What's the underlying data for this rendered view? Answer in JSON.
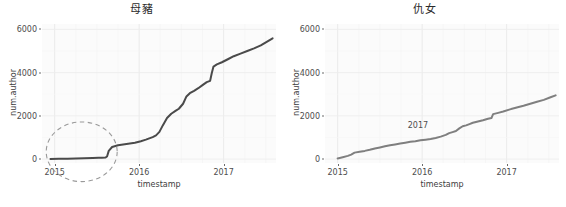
{
  "figure": {
    "width": 566,
    "height": 207,
    "background": "#ffffff",
    "panel_background": "#fbfbfb",
    "gridline_color": "#f0f0f0",
    "axis_text_color": "#4d4d4d"
  },
  "chart_data": [
    {
      "type": "line",
      "title": "母豬",
      "xlabel": "timestamp",
      "ylabel": "num.author",
      "grid": true,
      "legend": null,
      "line_color": "#4a4a4a",
      "line_width": 2.0,
      "xlim": [
        2014.85,
        2017.62
      ],
      "ylim": [
        -180,
        6250
      ],
      "xticks": [
        "2015",
        "2016",
        "2017"
      ],
      "xtick_values": [
        2015,
        2016,
        2017
      ],
      "yticks": [
        "0",
        "2000",
        "4000",
        "6000"
      ],
      "ytick_values": [
        0,
        2000,
        4000,
        6000
      ],
      "x": [
        2014.95,
        2015.05,
        2015.15,
        2015.25,
        2015.35,
        2015.45,
        2015.52,
        2015.56,
        2015.6,
        2015.62,
        2015.64,
        2015.68,
        2015.75,
        2015.85,
        2015.95,
        2016.02,
        2016.08,
        2016.12,
        2016.16,
        2016.2,
        2016.24,
        2016.28,
        2016.33,
        2016.38,
        2016.43,
        2016.47,
        2016.52,
        2016.56,
        2016.6,
        2016.65,
        2016.7,
        2016.75,
        2016.8,
        2016.84,
        2016.86,
        2016.88,
        2016.92,
        2016.98,
        2017.05,
        2017.12,
        2017.2,
        2017.28,
        2017.36,
        2017.44,
        2017.52,
        2017.58
      ],
      "y": [
        10,
        15,
        22,
        30,
        38,
        48,
        58,
        65,
        72,
        120,
        380,
        560,
        640,
        700,
        760,
        830,
        900,
        960,
        1020,
        1100,
        1260,
        1560,
        1900,
        2100,
        2230,
        2330,
        2560,
        2900,
        3050,
        3160,
        3280,
        3420,
        3560,
        3620,
        3980,
        4280,
        4380,
        4480,
        4620,
        4760,
        4880,
        5000,
        5120,
        5260,
        5450,
        5590
      ],
      "annotations": [
        {
          "type": "ellipse",
          "name": "highlight-ellipse",
          "style": "dashed",
          "color": "#9a9a9a",
          "center_x": 2015.32,
          "center_y": 340,
          "radius_x_years": 0.42,
          "radius_y_value": 1380
        }
      ]
    },
    {
      "type": "line",
      "title": "仇女",
      "xlabel": "timestamp",
      "ylabel": "num.author",
      "grid": true,
      "legend": null,
      "line_color": "#7f7f7f",
      "line_width": 2.0,
      "xlim": [
        2014.85,
        2017.62
      ],
      "ylim": [
        -180,
        6250
      ],
      "xticks": [
        "2015",
        "2016",
        "2017"
      ],
      "xtick_values": [
        2015,
        2016,
        2017
      ],
      "yticks": [
        "0",
        "2000",
        "4000",
        "6000"
      ],
      "ytick_values": [
        0,
        2000,
        4000,
        6000
      ],
      "x": [
        2015.0,
        2015.06,
        2015.12,
        2015.16,
        2015.2,
        2015.26,
        2015.32,
        2015.38,
        2015.44,
        2015.5,
        2015.56,
        2015.62,
        2015.68,
        2015.74,
        2015.8,
        2015.86,
        2015.92,
        2015.98,
        2016.04,
        2016.1,
        2016.16,
        2016.22,
        2016.28,
        2016.32,
        2016.36,
        2016.4,
        2016.44,
        2016.48,
        2016.52,
        2016.56,
        2016.6,
        2016.66,
        2016.72,
        2016.78,
        2016.82,
        2016.84,
        2016.9,
        2016.96,
        2017.04,
        2017.12,
        2017.2,
        2017.28,
        2017.36,
        2017.44,
        2017.52,
        2017.58
      ],
      "y": [
        30,
        90,
        150,
        210,
        300,
        340,
        380,
        430,
        490,
        540,
        590,
        640,
        680,
        720,
        760,
        800,
        830,
        870,
        900,
        930,
        980,
        1040,
        1120,
        1200,
        1250,
        1300,
        1420,
        1520,
        1560,
        1620,
        1680,
        1740,
        1800,
        1870,
        1900,
        2080,
        2140,
        2200,
        2300,
        2390,
        2470,
        2560,
        2650,
        2740,
        2860,
        2950
      ],
      "annotations": [
        {
          "type": "text",
          "name": "year-annotation",
          "text": "2017",
          "x": 2015.95,
          "y": 1560,
          "color": "#4d4d4d"
        }
      ]
    }
  ]
}
